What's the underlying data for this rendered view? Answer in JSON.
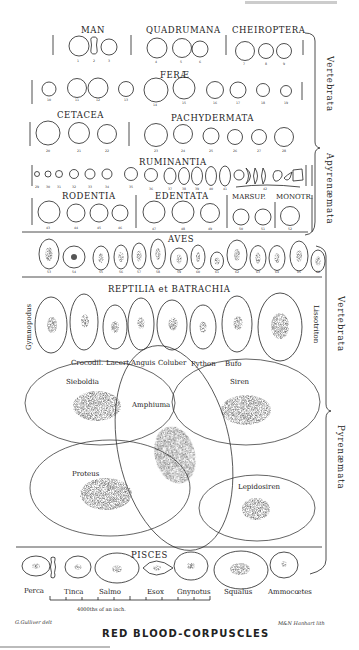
{
  "figure": {
    "title": "RED BLOOD-CORPUSCLES",
    "artist_signature": "G.Gulliver delt",
    "lithographer_signature": "M&N Hanhart lith",
    "scale_label": "4000ths of an inch.",
    "caption_fragment": "Gulliver's figures of red blood-corpuscles"
  },
  "brackets": {
    "apyrenaemata": {
      "line1": "Vertebrata",
      "line2": "Apyrenæmata"
    },
    "pyrenaemata": {
      "line1": "Vertebrata",
      "line2": "Pyrenæmata"
    }
  },
  "groups": {
    "man": {
      "label": "MAN",
      "numbers": [
        "1",
        "2",
        "3"
      ]
    },
    "quadrumana": {
      "label": "QUADRUMANA",
      "numbers": [
        "4",
        "5",
        "6"
      ]
    },
    "cheiroptera": {
      "label": "CHEIROPTERA",
      "numbers": [
        "7",
        "8",
        "9"
      ]
    },
    "ferae": {
      "label": "FERÆ",
      "numbers": [
        "10",
        "11",
        "12",
        "13",
        "14",
        "15",
        "16",
        "17",
        "18",
        "19"
      ]
    },
    "cetacea": {
      "label": "CETACEA",
      "numbers": [
        "20",
        "21",
        "22"
      ]
    },
    "pachydermata": {
      "label": "PACHYDERMATA",
      "numbers": [
        "23",
        "24",
        "25",
        "26",
        "27",
        "28"
      ]
    },
    "ruminantia": {
      "label": "RUMINANTIA",
      "numbers": [
        "29",
        "30",
        "31",
        "32",
        "33",
        "34",
        "35",
        "36",
        "37",
        "38",
        "39",
        "40",
        "41",
        "42"
      ]
    },
    "rodentia": {
      "label": "RODENTIA",
      "numbers": [
        "43",
        "44",
        "45",
        "46"
      ]
    },
    "edentata": {
      "label": "EDENTATA",
      "numbers": [
        "47",
        "48",
        "49"
      ]
    },
    "marsupialia": {
      "label": "MARSUP.",
      "numbers": [
        "50",
        "51"
      ]
    },
    "monotremata": {
      "label": "MONOTR.",
      "numbers": [
        "52"
      ]
    },
    "aves": {
      "label": "AVES",
      "numbers": [
        "53",
        "54",
        "55",
        "56",
        "57",
        "58",
        "59",
        "60",
        "61",
        "62",
        "63",
        "64",
        "65",
        "66"
      ]
    },
    "reptilia": {
      "label": "REPTILIA et BATRACHIA",
      "species": [
        "Gymnopodus",
        "Crocodil.",
        "Lacert.",
        "Anguis",
        "Coluber",
        "Python",
        "Bufo",
        "Lissotriton"
      ]
    },
    "amphibia_large": {
      "species": [
        "Sieboldia",
        "Amphiuma",
        "Siren",
        "Proteus",
        "Lepidosiren"
      ]
    },
    "pisces": {
      "label": "PISCES",
      "species": [
        "Perca",
        "Tinca",
        "Salmo",
        "Esox",
        "Gnynotus",
        "Squalus",
        "Ammocœtes"
      ]
    }
  }
}
